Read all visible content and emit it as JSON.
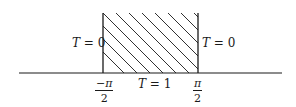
{
  "diagram": {
    "type": "boundary-value-region",
    "colors": {
      "line": "#1a1a1a",
      "hatch": "#1a1a1a",
      "background": "#ffffff"
    },
    "region": {
      "description": "semi-infinite strip, hatched",
      "left_bound": "-π/2",
      "right_bound": "π/2",
      "open_top": true
    },
    "labels": {
      "left_boundary": {
        "var": "T",
        "text": " = 0"
      },
      "right_boundary": {
        "var": "T",
        "text": " = 0"
      },
      "bottom_boundary": {
        "var": "T",
        "text": " = 1"
      }
    },
    "ticks": [
      {
        "numerator": "−π",
        "denominator": "2"
      },
      {
        "numerator": "π",
        "denominator": "2"
      }
    ]
  }
}
